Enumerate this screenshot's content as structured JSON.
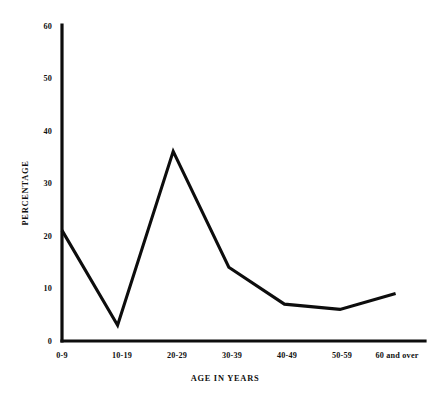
{
  "chart_data": {
    "type": "line",
    "title": "",
    "subtitle": "",
    "xlabel": "AGE IN YEARS",
    "ylabel": "PERCENTAGE",
    "categories": [
      "0-9",
      "10-19",
      "20-29",
      "30-39",
      "40-49",
      "50-59",
      "60 and over"
    ],
    "values": [
      21,
      3,
      36,
      14,
      7,
      6,
      9
    ],
    "series": [
      {
        "name": "percentage",
        "values": [
          21,
          3,
          36,
          14,
          7,
          6,
          9
        ]
      }
    ],
    "ylim": [
      0,
      60
    ],
    "yticks": [
      0,
      10,
      20,
      30,
      40,
      50,
      60
    ],
    "ytick_labels": [
      "0",
      "10",
      "20",
      "30",
      "40",
      "50",
      "60"
    ],
    "xtick_labels": [
      "0-9",
      "10-19",
      "20-29",
      "30-39",
      "40-49",
      "50-59",
      "60 and over"
    ],
    "grid": false,
    "legend": false,
    "legend_position": "none",
    "line_color": "#0d0d0d",
    "background_color": "#ffffff",
    "axis_color": "#0d0d0d",
    "annotations": []
  },
  "axis": {
    "y_title": "PERCENTAGE",
    "x_title": "AGE IN YEARS",
    "y_ticks": [
      {
        "label": "60",
        "value": 60
      },
      {
        "label": "50",
        "value": 50
      },
      {
        "label": "40",
        "value": 40
      },
      {
        "label": "30",
        "value": 30
      },
      {
        "label": "20",
        "value": 20
      },
      {
        "label": "10",
        "value": 10
      },
      {
        "label": "0",
        "value": 0
      }
    ],
    "x_ticks": [
      {
        "label": "0-9"
      },
      {
        "label": "10-19"
      },
      {
        "label": "20-29"
      },
      {
        "label": "30-39"
      },
      {
        "label": "40-49"
      },
      {
        "label": "50-59"
      },
      {
        "label": "60 and over"
      }
    ]
  }
}
